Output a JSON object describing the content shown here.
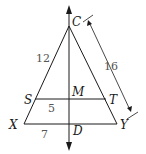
{
  "diagram": {
    "type": "geometry-triangle",
    "points": {
      "C": "C",
      "S": "S",
      "M": "M",
      "T": "T",
      "X": "X",
      "D": "D",
      "Y": "Y"
    },
    "measures": {
      "CS": "12",
      "CY": "16",
      "SM": "5",
      "XD": "7"
    },
    "colors": {
      "line": "#1a1a1a",
      "label": "#1a1a1a",
      "number": "#555555",
      "background": "#ffffff"
    }
  }
}
